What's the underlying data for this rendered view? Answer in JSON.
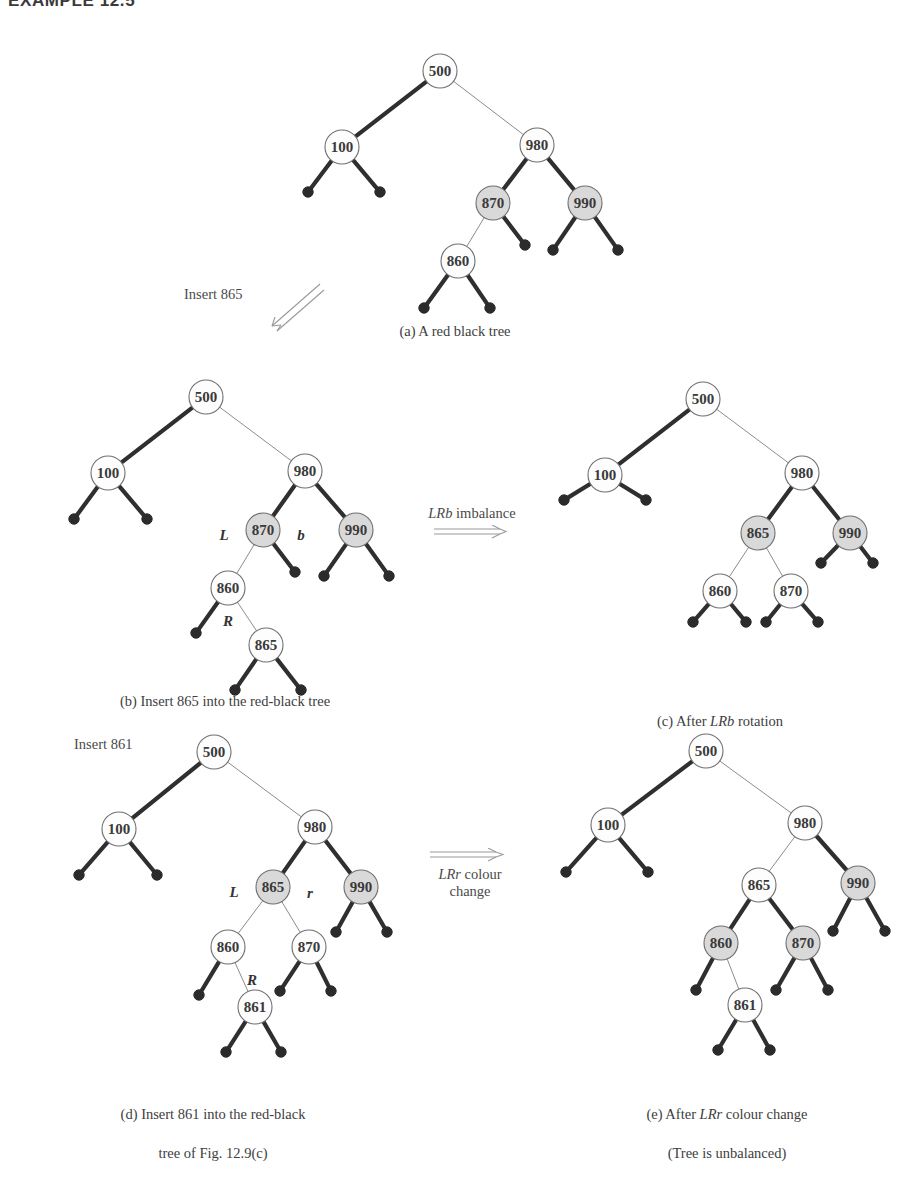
{
  "page": {
    "heading": "EXAMPLE 12.5",
    "figure_kind": "red-black tree insertion sequence"
  },
  "captions": {
    "a": "(a) A red black tree",
    "b": "(b) Insert 865 into the red-black tree",
    "c_prefix": "(c) After ",
    "c_italic": "LRb",
    "c_suffix": " rotation",
    "d_line1": "(d) Insert 861 into the red-black",
    "d_line2": "tree of Fig. 12.9(c)",
    "e_line1_prefix": "(e) After ",
    "e_line1_italic": "LRr",
    "e_line1_suffix": " colour change",
    "e_line2": "(Tree is unbalanced)"
  },
  "annotations": {
    "insert_865": "Insert 865",
    "insert_861": "Insert 861",
    "lrb_imbalance_italic": "LRb",
    "lrb_imbalance_rest": " imbalance",
    "lrr_change_italic": "LRr",
    "lrr_change_rest": " colour",
    "lrr_change_line2": "change"
  },
  "colors": {
    "ink": "#3a3a3a",
    "node_stroke": "#6f6f6f",
    "node_fill_white": "#fdfdfd",
    "node_fill_shaded": "#d9d9d9",
    "edge_black": "#2f2f2f",
    "edge_red": "#8c8c8c",
    "leaf_fill": "#2b2b2b",
    "text": "#3d3d3d"
  },
  "trees": {
    "a": {
      "label": "tree-a",
      "nodes": [
        {
          "id": "a500",
          "value": "500",
          "x": 140,
          "y": 31,
          "shaded": false
        },
        {
          "id": "a100",
          "value": "100",
          "x": 42,
          "y": 107,
          "shaded": false
        },
        {
          "id": "a980",
          "value": "980",
          "x": 237,
          "y": 105,
          "shaded": false
        },
        {
          "id": "a870",
          "value": "870",
          "x": 193,
          "y": 163,
          "shaded": true
        },
        {
          "id": "a990",
          "value": "990",
          "x": 285,
          "y": 163,
          "shaded": true
        },
        {
          "id": "a860",
          "value": "860",
          "x": 158,
          "y": 221,
          "shaded": false
        }
      ],
      "leaves": [
        {
          "x": 8,
          "y": 152
        },
        {
          "x": 80,
          "y": 152
        },
        {
          "x": 225,
          "y": 205
        },
        {
          "x": 253,
          "y": 210
        },
        {
          "x": 318,
          "y": 210
        },
        {
          "x": 124,
          "y": 268
        },
        {
          "x": 190,
          "y": 268
        }
      ],
      "edges": [
        {
          "from": "a500",
          "to": "a100",
          "style": "black"
        },
        {
          "from": "a500",
          "to": "a980",
          "style": "red"
        },
        {
          "from": "a100",
          "lx": 8,
          "ly": 152,
          "style": "black"
        },
        {
          "from": "a100",
          "lx": 80,
          "ly": 152,
          "style": "black"
        },
        {
          "from": "a980",
          "to": "a870",
          "style": "black"
        },
        {
          "from": "a980",
          "to": "a990",
          "style": "black"
        },
        {
          "from": "a870",
          "to": "a860",
          "style": "red"
        },
        {
          "from": "a870",
          "lx": 225,
          "ly": 205,
          "style": "black"
        },
        {
          "from": "a990",
          "lx": 253,
          "ly": 210,
          "style": "black"
        },
        {
          "from": "a990",
          "lx": 318,
          "ly": 210,
          "style": "black"
        },
        {
          "from": "a860",
          "lx": 124,
          "ly": 268,
          "style": "black"
        },
        {
          "from": "a860",
          "lx": 190,
          "ly": 268,
          "style": "black"
        }
      ]
    },
    "b": {
      "label": "tree-b",
      "nodes": [
        {
          "id": "b500",
          "value": "500",
          "x": 190,
          "y": 24,
          "shaded": false
        },
        {
          "id": "b100",
          "value": "100",
          "x": 92,
          "y": 100,
          "shaded": false
        },
        {
          "id": "b980",
          "value": "980",
          "x": 289,
          "y": 98,
          "shaded": false
        },
        {
          "id": "b870",
          "value": "870",
          "x": 247,
          "y": 157,
          "shaded": true
        },
        {
          "id": "b990",
          "value": "990",
          "x": 340,
          "y": 157,
          "shaded": true
        },
        {
          "id": "b860",
          "value": "860",
          "x": 212,
          "y": 215,
          "shaded": false
        },
        {
          "id": "b865",
          "value": "865",
          "x": 250,
          "y": 272,
          "shaded": false
        }
      ],
      "leaves": [
        {
          "x": 58,
          "y": 146
        },
        {
          "x": 131,
          "y": 146
        },
        {
          "x": 279,
          "y": 199
        },
        {
          "x": 308,
          "y": 203
        },
        {
          "x": 373,
          "y": 203
        },
        {
          "x": 180,
          "y": 260
        },
        {
          "x": 219,
          "y": 317
        },
        {
          "x": 285,
          "y": 317
        }
      ],
      "edges": [
        {
          "from": "b500",
          "to": "b100",
          "style": "black"
        },
        {
          "from": "b500",
          "to": "b980",
          "style": "red"
        },
        {
          "from": "b100",
          "lx": 58,
          "ly": 146,
          "style": "black"
        },
        {
          "from": "b100",
          "lx": 131,
          "ly": 146,
          "style": "black"
        },
        {
          "from": "b980",
          "to": "b870",
          "style": "black"
        },
        {
          "from": "b980",
          "to": "b990",
          "style": "black"
        },
        {
          "from": "b870",
          "to": "b860",
          "style": "red"
        },
        {
          "from": "b870",
          "lx": 279,
          "ly": 199,
          "style": "black"
        },
        {
          "from": "b990",
          "lx": 308,
          "ly": 203,
          "style": "black"
        },
        {
          "from": "b990",
          "lx": 373,
          "ly": 203,
          "style": "black"
        },
        {
          "from": "b860",
          "lx": 180,
          "ly": 260,
          "style": "black"
        },
        {
          "from": "b860",
          "to": "b865",
          "style": "red"
        },
        {
          "from": "b865",
          "lx": 219,
          "ly": 317,
          "style": "black"
        },
        {
          "from": "b865",
          "lx": 285,
          "ly": 317,
          "style": "black"
        }
      ],
      "edge_labels": [
        {
          "text": "L",
          "x": 208,
          "y": 167
        },
        {
          "text": "b",
          "x": 285,
          "y": 167
        },
        {
          "text": "R",
          "x": 212,
          "y": 253
        }
      ]
    },
    "c": {
      "label": "tree-c",
      "nodes": [
        {
          "id": "c500",
          "value": "500",
          "x": 155,
          "y": 26,
          "shaded": false
        },
        {
          "id": "c100",
          "value": "100",
          "x": 57,
          "y": 102,
          "shaded": false
        },
        {
          "id": "c980",
          "value": "980",
          "x": 254,
          "y": 100,
          "shaded": false
        },
        {
          "id": "c865",
          "value": "865",
          "x": 210,
          "y": 160,
          "shaded": true
        },
        {
          "id": "c990",
          "value": "990",
          "x": 302,
          "y": 160,
          "shaded": true
        },
        {
          "id": "c860",
          "value": "860",
          "x": 172,
          "y": 218,
          "shaded": false
        },
        {
          "id": "c870",
          "value": "870",
          "x": 243,
          "y": 218,
          "shaded": false
        }
      ],
      "leaves": [
        {
          "x": 16,
          "y": 127
        },
        {
          "x": 98,
          "y": 127
        },
        {
          "x": 273,
          "y": 190
        },
        {
          "x": 325,
          "y": 190
        },
        {
          "x": 145,
          "y": 249
        },
        {
          "x": 198,
          "y": 249
        },
        {
          "x": 218,
          "y": 249
        },
        {
          "x": 270,
          "y": 249
        }
      ],
      "edges": [
        {
          "from": "c500",
          "to": "c100",
          "style": "black"
        },
        {
          "from": "c500",
          "to": "c980",
          "style": "red"
        },
        {
          "from": "c100",
          "lx": 16,
          "ly": 127,
          "style": "black"
        },
        {
          "from": "c100",
          "lx": 98,
          "ly": 127,
          "style": "black"
        },
        {
          "from": "c980",
          "to": "c865",
          "style": "black"
        },
        {
          "from": "c980",
          "to": "c990",
          "style": "black"
        },
        {
          "from": "c865",
          "to": "c860",
          "style": "red"
        },
        {
          "from": "c865",
          "to": "c870",
          "style": "red"
        },
        {
          "from": "c990",
          "lx": 273,
          "ly": 190,
          "style": "black"
        },
        {
          "from": "c990",
          "lx": 325,
          "ly": 190,
          "style": "black"
        },
        {
          "from": "c860",
          "lx": 145,
          "ly": 249,
          "style": "black"
        },
        {
          "from": "c860",
          "lx": 198,
          "ly": 249,
          "style": "black"
        },
        {
          "from": "c870",
          "lx": 218,
          "ly": 249,
          "style": "black"
        },
        {
          "from": "c870",
          "lx": 270,
          "ly": 249,
          "style": "black"
        }
      ]
    },
    "d": {
      "label": "tree-d",
      "nodes": [
        {
          "id": "d500",
          "value": "500",
          "x": 198,
          "y": 30,
          "shaded": false
        },
        {
          "id": "d100",
          "value": "100",
          "x": 103,
          "y": 107,
          "shaded": false
        },
        {
          "id": "d980",
          "value": "980",
          "x": 299,
          "y": 105,
          "shaded": false
        },
        {
          "id": "d865",
          "value": "865",
          "x": 257,
          "y": 165,
          "shaded": true
        },
        {
          "id": "d990",
          "value": "990",
          "x": 345,
          "y": 165,
          "shaded": true
        },
        {
          "id": "d860",
          "value": "860",
          "x": 212,
          "y": 225,
          "shaded": false
        },
        {
          "id": "d870",
          "value": "870",
          "x": 293,
          "y": 225,
          "shaded": false
        },
        {
          "id": "d861",
          "value": "861",
          "x": 239,
          "y": 285,
          "shaded": false
        }
      ],
      "leaves": [
        {
          "x": 63,
          "y": 153
        },
        {
          "x": 141,
          "y": 153
        },
        {
          "x": 320,
          "y": 210
        },
        {
          "x": 371,
          "y": 210
        },
        {
          "x": 183,
          "y": 273
        },
        {
          "x": 264,
          "y": 269
        },
        {
          "x": 315,
          "y": 269
        },
        {
          "x": 210,
          "y": 330
        },
        {
          "x": 265,
          "y": 330
        }
      ],
      "edges": [
        {
          "from": "d500",
          "to": "d100",
          "style": "black"
        },
        {
          "from": "d500",
          "to": "d980",
          "style": "red"
        },
        {
          "from": "d100",
          "lx": 63,
          "ly": 153,
          "style": "black"
        },
        {
          "from": "d100",
          "lx": 141,
          "ly": 153,
          "style": "black"
        },
        {
          "from": "d980",
          "to": "d865",
          "style": "black"
        },
        {
          "from": "d980",
          "to": "d990",
          "style": "black"
        },
        {
          "from": "d865",
          "to": "d860",
          "style": "red"
        },
        {
          "from": "d865",
          "to": "d870",
          "style": "red"
        },
        {
          "from": "d990",
          "lx": 320,
          "ly": 210,
          "style": "black"
        },
        {
          "from": "d990",
          "lx": 371,
          "ly": 210,
          "style": "black"
        },
        {
          "from": "d860",
          "lx": 183,
          "ly": 273,
          "style": "black"
        },
        {
          "from": "d860",
          "to": "d861",
          "style": "red"
        },
        {
          "from": "d870",
          "lx": 264,
          "ly": 269,
          "style": "black"
        },
        {
          "from": "d870",
          "lx": 315,
          "ly": 269,
          "style": "black"
        },
        {
          "from": "d861",
          "lx": 210,
          "ly": 330,
          "style": "black"
        },
        {
          "from": "d861",
          "lx": 265,
          "ly": 330,
          "style": "black"
        }
      ],
      "edge_labels": [
        {
          "text": "L",
          "x": 218,
          "y": 175
        },
        {
          "text": "r",
          "x": 294,
          "y": 176
        },
        {
          "text": "R",
          "x": 236,
          "y": 263
        }
      ]
    },
    "e": {
      "label": "tree-e",
      "nodes": [
        {
          "id": "e500",
          "value": "500",
          "x": 158,
          "y": 29,
          "shaded": false
        },
        {
          "id": "e100",
          "value": "100",
          "x": 60,
          "y": 103,
          "shaded": false
        },
        {
          "id": "e980",
          "value": "980",
          "x": 257,
          "y": 101,
          "shaded": false
        },
        {
          "id": "e865",
          "value": "865",
          "x": 211,
          "y": 163,
          "shaded": false
        },
        {
          "id": "e990",
          "value": "990",
          "x": 310,
          "y": 161,
          "shaded": true
        },
        {
          "id": "e860",
          "value": "860",
          "x": 173,
          "y": 221,
          "shaded": true
        },
        {
          "id": "e870",
          "value": "870",
          "x": 255,
          "y": 221,
          "shaded": true
        },
        {
          "id": "e861",
          "value": "861",
          "x": 197,
          "y": 283,
          "shaded": false
        }
      ],
      "leaves": [
        {
          "x": 18,
          "y": 150
        },
        {
          "x": 100,
          "y": 150
        },
        {
          "x": 285,
          "y": 209
        },
        {
          "x": 337,
          "y": 209
        },
        {
          "x": 148,
          "y": 268
        },
        {
          "x": 228,
          "y": 268
        },
        {
          "x": 280,
          "y": 268
        },
        {
          "x": 170,
          "y": 328
        },
        {
          "x": 222,
          "y": 328
        }
      ],
      "edges": [
        {
          "from": "e500",
          "to": "e100",
          "style": "black"
        },
        {
          "from": "e500",
          "to": "e980",
          "style": "red"
        },
        {
          "from": "e100",
          "lx": 18,
          "ly": 150,
          "style": "black"
        },
        {
          "from": "e100",
          "lx": 100,
          "ly": 150,
          "style": "black"
        },
        {
          "from": "e980",
          "to": "e865",
          "style": "red"
        },
        {
          "from": "e980",
          "to": "e990",
          "style": "black"
        },
        {
          "from": "e865",
          "to": "e860",
          "style": "black"
        },
        {
          "from": "e865",
          "to": "e870",
          "style": "black"
        },
        {
          "from": "e990",
          "lx": 285,
          "ly": 209,
          "style": "black"
        },
        {
          "from": "e990",
          "lx": 337,
          "ly": 209,
          "style": "black"
        },
        {
          "from": "e860",
          "lx": 148,
          "ly": 268,
          "style": "black"
        },
        {
          "from": "e860",
          "to": "e861",
          "style": "red"
        },
        {
          "from": "e870",
          "lx": 228,
          "ly": 268,
          "style": "black"
        },
        {
          "from": "e870",
          "lx": 280,
          "ly": 268,
          "style": "black"
        },
        {
          "from": "e861",
          "lx": 170,
          "ly": 328,
          "style": "black"
        },
        {
          "from": "e861",
          "lx": 222,
          "ly": 328,
          "style": "black"
        }
      ]
    }
  }
}
